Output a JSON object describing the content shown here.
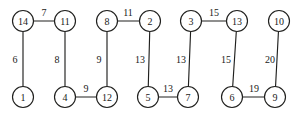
{
  "figure": {
    "type": "undirected-weighted-graph",
    "background_color": "#ffffff",
    "stroke_color": "#20201e",
    "text_color": "#1a1a18",
    "node_radius": 10.5
  },
  "chart_data": {
    "type": "diagram",
    "title": "",
    "xlabel": "",
    "ylabel": "",
    "nodes": [
      {
        "id": "n14",
        "label": "14",
        "x": 23,
        "y": 21
      },
      {
        "id": "n11",
        "label": "11",
        "x": 65,
        "y": 21
      },
      {
        "id": "n8",
        "label": "8",
        "x": 107,
        "y": 21
      },
      {
        "id": "n2",
        "label": "2",
        "x": 150,
        "y": 21
      },
      {
        "id": "n3",
        "label": "3",
        "x": 191,
        "y": 21
      },
      {
        "id": "n13",
        "label": "13",
        "x": 237,
        "y": 21
      },
      {
        "id": "n10",
        "label": "10",
        "x": 279,
        "y": 21
      },
      {
        "id": "n1",
        "label": "1",
        "x": 23,
        "y": 97
      },
      {
        "id": "n4",
        "label": "4",
        "x": 65,
        "y": 97
      },
      {
        "id": "n12",
        "label": "12",
        "x": 107,
        "y": 97
      },
      {
        "id": "n5",
        "label": "5",
        "x": 148,
        "y": 97
      },
      {
        "id": "n7",
        "label": "7",
        "x": 188,
        "y": 97
      },
      {
        "id": "n6",
        "label": "6",
        "x": 232,
        "y": 97
      },
      {
        "id": "n9",
        "label": "9",
        "x": 275,
        "y": 97
      }
    ],
    "edges": [
      {
        "id": "e-14-11",
        "source": "n14",
        "target": "n11",
        "weight": "7",
        "label_x": 44,
        "label_y": 12
      },
      {
        "id": "e-14-1",
        "source": "n14",
        "target": "n1",
        "weight": "6",
        "label_x": 15,
        "label_y": 59
      },
      {
        "id": "e-11-4",
        "source": "n11",
        "target": "n4",
        "weight": "8",
        "label_x": 57,
        "label_y": 59
      },
      {
        "id": "e-8-2",
        "source": "n8",
        "target": "n2",
        "weight": "11",
        "label_x": 128,
        "label_y": 12
      },
      {
        "id": "e-8-12",
        "source": "n8",
        "target": "n12",
        "weight": "9",
        "label_x": 99,
        "label_y": 59
      },
      {
        "id": "e-4-12",
        "source": "n4",
        "target": "n12",
        "weight": "9",
        "label_x": 86,
        "label_y": 88
      },
      {
        "id": "e-2-5",
        "source": "n2",
        "target": "n5",
        "weight": "13",
        "label_x": 140,
        "label_y": 59
      },
      {
        "id": "e-3-13",
        "source": "n3",
        "target": "n13",
        "weight": "15",
        "label_x": 214,
        "label_y": 12
      },
      {
        "id": "e-3-7",
        "source": "n3",
        "target": "n7",
        "weight": "13",
        "label_x": 181,
        "label_y": 59
      },
      {
        "id": "e-5-7",
        "source": "n5",
        "target": "n7",
        "weight": "13",
        "label_x": 168,
        "label_y": 88
      },
      {
        "id": "e-13-6",
        "source": "n13",
        "target": "n6",
        "weight": "15",
        "label_x": 226,
        "label_y": 59
      },
      {
        "id": "e-10-9",
        "source": "n10",
        "target": "n9",
        "weight": "20",
        "label_x": 270,
        "label_y": 59
      },
      {
        "id": "e-6-9",
        "source": "n6",
        "target": "n9",
        "weight": "19",
        "label_x": 254,
        "label_y": 88
      }
    ]
  }
}
